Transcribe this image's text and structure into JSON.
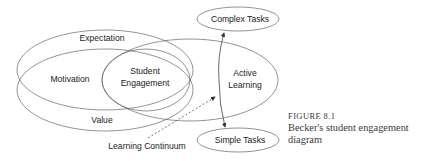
{
  "diagram": {
    "nodes": {
      "expectation": "Expectation",
      "motivation": "Motivation",
      "value": "Value",
      "student_engagement_line1": "Student",
      "student_engagement_line2": "Engagement",
      "active_learning_line1": "Active",
      "active_learning_line2": "Learning",
      "complex_tasks": "Complex Tasks",
      "simple_tasks": "Simple Tasks",
      "learning_continuum": "Learning Continuum"
    },
    "stroke_color": "#555555"
  },
  "caption": {
    "figure_number": "FIGURE 8.1",
    "text": "Becker's student engagement diagram"
  }
}
